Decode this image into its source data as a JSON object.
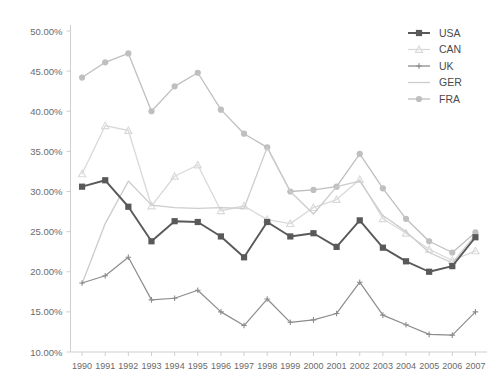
{
  "chart_data": {
    "type": "line",
    "title": "",
    "xlabel": "",
    "ylabel": "",
    "x": [
      1990,
      1991,
      1992,
      1993,
      1994,
      1995,
      1996,
      1997,
      1998,
      1999,
      2000,
      2001,
      2002,
      2003,
      2004,
      2005,
      2006,
      2007
    ],
    "categories": [
      "1990",
      "1991",
      "1992",
      "1993",
      "1994",
      "1995",
      "1996",
      "1997",
      "1998",
      "1999",
      "2000",
      "2001",
      "2002",
      "2003",
      "2004",
      "2005",
      "2006",
      "2007"
    ],
    "ylim": [
      10,
      50
    ],
    "yticks": [
      10,
      15,
      20,
      25,
      30,
      35,
      40,
      45,
      50
    ],
    "ytick_labels": [
      "10.00%",
      "15.00%",
      "20.00%",
      "25.00%",
      "30.00%",
      "35.00%",
      "40.00%",
      "45.00%",
      "50.00%"
    ],
    "grid": false,
    "legend_position": "top-right",
    "series": [
      {
        "name": "USA",
        "color": "#595959",
        "marker": "square",
        "values": [
          30.6,
          31.4,
          28.1,
          23.8,
          26.3,
          26.2,
          24.4,
          21.8,
          26.2,
          24.4,
          24.8,
          23.1,
          26.4,
          23.0,
          21.3,
          20.0,
          20.7,
          24.3
        ]
      },
      {
        "name": "CAN",
        "color": "#d9d9d9",
        "marker": "triangle",
        "values": [
          32.2,
          38.2,
          37.6,
          28.2,
          31.9,
          33.3,
          27.6,
          28.2,
          26.5,
          26.0,
          28.0,
          29.0,
          31.5,
          26.6,
          24.8,
          22.8,
          21.4,
          22.6
        ]
      },
      {
        "name": "UK",
        "color": "#8c8c8c",
        "marker": "plus",
        "values": [
          18.6,
          19.5,
          21.8,
          16.5,
          16.7,
          17.7,
          15.0,
          13.3,
          16.6,
          13.7,
          14.0,
          14.8,
          18.7,
          14.6,
          13.4,
          12.2,
          12.1,
          15.0
        ]
      },
      {
        "name": "GER",
        "color": "#cccccc",
        "marker": "none",
        "values": [
          18.5,
          26.0,
          31.3,
          28.3,
          28.0,
          27.9,
          28.0,
          27.9,
          35.5,
          30.0,
          27.2,
          30.6,
          31.3,
          27.0,
          25.0,
          22.4,
          21.1,
          24.6
        ]
      },
      {
        "name": "FRA",
        "color": "#bfbfbf",
        "marker": "circle",
        "values": [
          44.2,
          46.1,
          47.2,
          40.0,
          43.1,
          44.8,
          40.2,
          37.2,
          35.5,
          30.0,
          30.2,
          30.6,
          34.7,
          30.4,
          26.6,
          23.8,
          22.4,
          24.9
        ]
      }
    ]
  },
  "legend": {
    "items": [
      {
        "label": "USA"
      },
      {
        "label": "CAN"
      },
      {
        "label": "UK"
      },
      {
        "label": "GER"
      },
      {
        "label": "FRA"
      }
    ]
  }
}
